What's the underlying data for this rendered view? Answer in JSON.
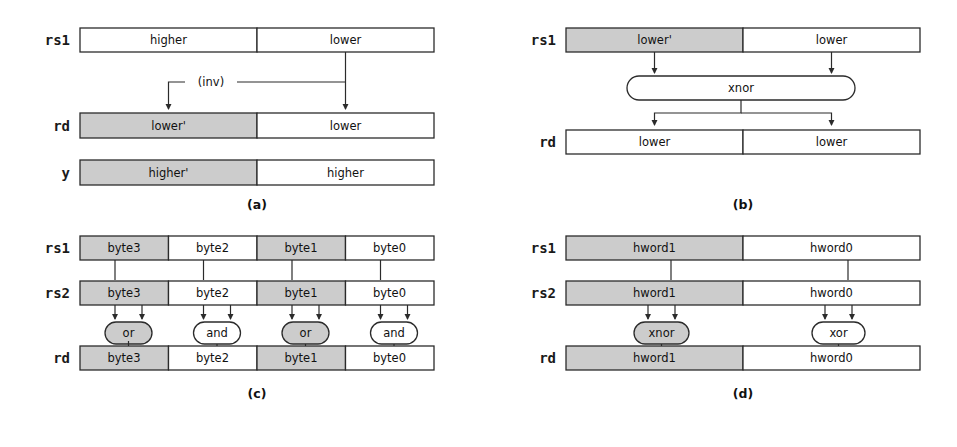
{
  "figure": {
    "background": "#ffffff",
    "shaded_color": "#cccccc",
    "plain_color": "#ffffff",
    "line_color": "#2b2b2b"
  },
  "panels": [
    {
      "id": "a",
      "caption": "(a)",
      "registers": [
        {
          "name": "rs1",
          "cells": [
            {
              "label": "higher",
              "shaded": false
            },
            {
              "label": "lower",
              "shaded": false
            }
          ]
        },
        {
          "name": "rd",
          "cells": [
            {
              "label": "lower'",
              "shaded": true
            },
            {
              "label": "lower",
              "shaded": false
            }
          ]
        },
        {
          "name": "y",
          "cells": [
            {
              "label": "higher'",
              "shaded": true
            },
            {
              "label": "higher",
              "shaded": false
            }
          ]
        }
      ],
      "annotations": [
        {
          "label": "(inv)"
        }
      ],
      "gates": []
    },
    {
      "id": "b",
      "caption": "(b)",
      "registers": [
        {
          "name": "rs1",
          "cells": [
            {
              "label": "lower'",
              "shaded": true
            },
            {
              "label": "lower",
              "shaded": false
            }
          ]
        },
        {
          "name": "rd",
          "cells": [
            {
              "label": "lower",
              "shaded": false
            },
            {
              "label": "lower",
              "shaded": false
            }
          ]
        }
      ],
      "annotations": [],
      "gates": [
        {
          "label": "xnor",
          "shaded": false,
          "wide": true
        }
      ]
    },
    {
      "id": "c",
      "caption": "(c)",
      "registers": [
        {
          "name": "rs1",
          "cells": [
            {
              "label": "byte3",
              "shaded": true
            },
            {
              "label": "byte2",
              "shaded": false
            },
            {
              "label": "byte1",
              "shaded": true
            },
            {
              "label": "byte0",
              "shaded": false
            }
          ]
        },
        {
          "name": "rs2",
          "cells": [
            {
              "label": "byte3",
              "shaded": true
            },
            {
              "label": "byte2",
              "shaded": false
            },
            {
              "label": "byte1",
              "shaded": true
            },
            {
              "label": "byte0",
              "shaded": false
            }
          ]
        },
        {
          "name": "rd",
          "cells": [
            {
              "label": "byte3",
              "shaded": true
            },
            {
              "label": "byte2",
              "shaded": false
            },
            {
              "label": "byte1",
              "shaded": true
            },
            {
              "label": "byte0",
              "shaded": false
            }
          ]
        }
      ],
      "annotations": [],
      "gates": [
        {
          "label": "or",
          "shaded": true,
          "wide": false
        },
        {
          "label": "and",
          "shaded": false,
          "wide": false
        },
        {
          "label": "or",
          "shaded": true,
          "wide": false
        },
        {
          "label": "and",
          "shaded": false,
          "wide": false
        }
      ]
    },
    {
      "id": "d",
      "caption": "(d)",
      "registers": [
        {
          "name": "rs1",
          "cells": [
            {
              "label": "hword1",
              "shaded": true
            },
            {
              "label": "hword0",
              "shaded": false
            }
          ]
        },
        {
          "name": "rs2",
          "cells": [
            {
              "label": "hword1",
              "shaded": true
            },
            {
              "label": "hword0",
              "shaded": false
            }
          ]
        },
        {
          "name": "rd",
          "cells": [
            {
              "label": "hword1",
              "shaded": true
            },
            {
              "label": "hword0",
              "shaded": false
            }
          ]
        }
      ],
      "annotations": [],
      "gates": [
        {
          "label": "xnor",
          "shaded": true,
          "wide": false
        },
        {
          "label": "xor",
          "shaded": false,
          "wide": false
        }
      ]
    }
  ]
}
